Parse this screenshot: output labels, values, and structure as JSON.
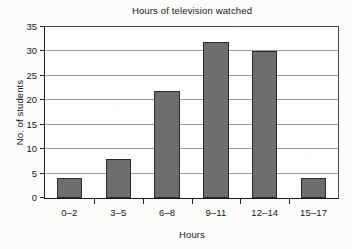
{
  "chart_data": {
    "type": "bar",
    "title": "Hours of television watched",
    "xlabel": "Hours",
    "ylabel": "No. of students",
    "categories": [
      "0–2",
      "3–5",
      "6–8",
      "9–11",
      "12–14",
      "15–17"
    ],
    "values": [
      4,
      8,
      22,
      32,
      30,
      4
    ],
    "ylim": [
      0,
      35
    ],
    "yticks": [
      0,
      5,
      10,
      15,
      20,
      25,
      30,
      35
    ],
    "ytick_labels": [
      "0",
      "5",
      "10",
      "15",
      "20",
      "25",
      "30",
      "35"
    ],
    "grid": "horizontal",
    "legend": "none",
    "colors": {
      "bar_fill": "#6e6e6e",
      "bar_stroke": "#2b2b2b",
      "gridline": "#9a9a9a",
      "axis": "#1b1b1b",
      "plot_background": "#ffffff",
      "page_background": "#fbfbfa",
      "text": "#161616"
    }
  }
}
